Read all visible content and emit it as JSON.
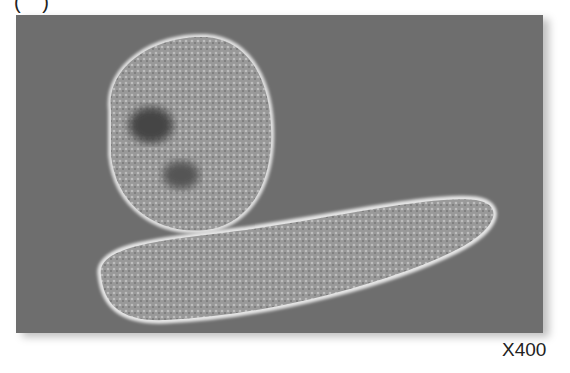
{
  "figure": {
    "panel_label": "( )",
    "magnification": "X400",
    "colors": {
      "background": "#6e6e6e",
      "cell_fill": "#9a9a9a",
      "halo": "#e8e8e8"
    }
  }
}
